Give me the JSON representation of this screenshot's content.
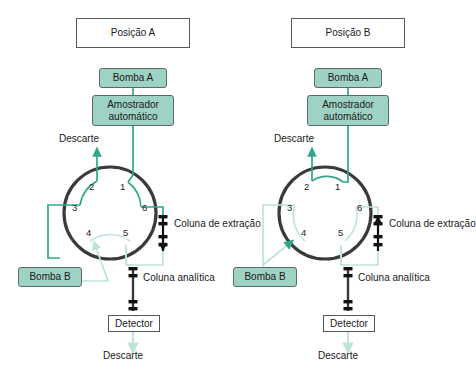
{
  "figure": {
    "type": "diagram",
    "language": "pt-BR"
  },
  "colors": {
    "teal_fill": "#9ed2c4",
    "flow_active": "#34a58a",
    "flow_inactive": "#bfe3d9",
    "valve_ring": "#3a3a3a",
    "box_border": "#555a5f",
    "text": "#1a1a1a",
    "column_packing": "#111111"
  },
  "panels": [
    {
      "id": "panel-a",
      "title": "Posição A",
      "pump_top": "Bomba A",
      "sampler": "Amostrador automático",
      "pump_left": "Bomba B",
      "waste_top": "Descarte",
      "waste_bottom": "Descarte",
      "extraction_column": "Coluna de extração",
      "extraction_flow_direction": "down",
      "analytical_column": "Coluna analítica",
      "detector": "Detector",
      "port_labels": [
        "1",
        "2",
        "3",
        "4",
        "5",
        "6"
      ],
      "internal_connections": [
        {
          "from": "2",
          "to": "3",
          "state": "active"
        },
        {
          "from": "1",
          "to": "6",
          "state": "active"
        },
        {
          "from": "4",
          "to": "5",
          "state": "inactive"
        }
      ]
    },
    {
      "id": "panel-b",
      "title": "Posição B",
      "pump_top": "Bomba A",
      "sampler": "Amostrador automático",
      "pump_left": "Bomba B",
      "waste_top": "Descarte",
      "waste_bottom": "Descarte",
      "extraction_column": "Coluna de extração",
      "extraction_flow_direction": "up",
      "analytical_column": "Coluna analítica",
      "detector": "Detector",
      "port_labels": [
        "1",
        "2",
        "3",
        "4",
        "5",
        "6"
      ],
      "internal_connections": [
        {
          "from": "1",
          "to": "2",
          "state": "active"
        },
        {
          "from": "3",
          "to": "4",
          "state": "inactive"
        },
        {
          "from": "5",
          "to": "6",
          "state": "inactive"
        }
      ]
    }
  ]
}
